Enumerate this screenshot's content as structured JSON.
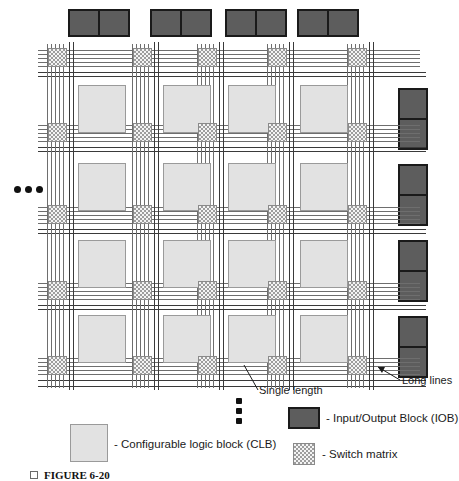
{
  "figure": {
    "caption_label": "FIGURE 6-20",
    "caption_marker": "square-bullet"
  },
  "colors": {
    "iob_fill": "#5a5a5a",
    "iob_border": "#1a1a1a",
    "clb_fill": "#e2e2e2",
    "clb_border": "#9a9a9a",
    "switch_matrix_fill": "#f4f4f4",
    "switch_matrix_hatch": "#9d9d9d",
    "routing_line": "#6e6e6e",
    "long_line": "#3a3a3a",
    "text": "#1a1a1a",
    "background": "#ffffff"
  },
  "annotations": {
    "single_length": "Single length",
    "long_lines": "Long lines"
  },
  "legend": {
    "items": [
      {
        "key": "clb",
        "symbol": "clb-swatch",
        "label": "- Configurable logic block (CLB)"
      },
      {
        "key": "iob",
        "symbol": "iob-swatch",
        "label": "- Input/Output Block (IOB)"
      },
      {
        "key": "switch_matrix",
        "symbol": "switch-matrix-swatch",
        "label": "- Switch matrix"
      }
    ]
  },
  "grid": {
    "rows": 4,
    "columns": 4,
    "switch_matrix_rows": 5,
    "switch_matrix_columns": 5,
    "clb_count": 16,
    "switch_matrix_count": 25,
    "routing_lines_per_channel": 5,
    "long_lines_per_channel": 2
  },
  "io_blocks": {
    "top_count": 4,
    "right_count": 4,
    "cells_per_block": 2
  },
  "continuation": {
    "left_ellipsis": "•••",
    "bottom_ellipsis": "•••",
    "left_dots": 3,
    "bottom_dots": 3
  }
}
